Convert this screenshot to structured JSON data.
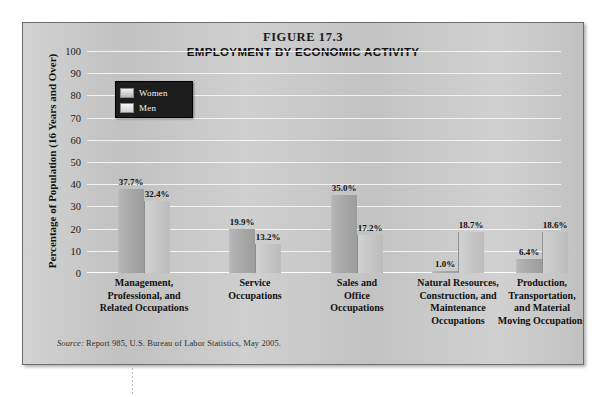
{
  "figure": {
    "number": "FIGURE 17.3",
    "title": "EMPLOYMENT BY ECONOMIC ACTIVITY",
    "source_word": "Source:",
    "source_text": " Report 985, U.S. Bureau of Labor Statistics, May 2005."
  },
  "legend": {
    "women_label": "Women",
    "men_label": "Men"
  },
  "axis": {
    "y_title": "Percentage of Population (16 Years and Over)",
    "ticks": [
      "100",
      "90",
      "80",
      "70",
      "60",
      "50",
      "40",
      "30",
      "20",
      "10",
      "0"
    ]
  },
  "categories": [
    {
      "line1": "Management,",
      "line2": "Professional, and",
      "line3": "Related Occupations"
    },
    {
      "line1": "Service",
      "line2": "Occupations",
      "line3": ""
    },
    {
      "line1": "Sales and",
      "line2": "Office",
      "line3": "Occupations"
    },
    {
      "line1": "Natural Resources,",
      "line2": "Construction, and",
      "line3": "Maintenance",
      "line4": "Occupations"
    },
    {
      "line1": "Production,",
      "line2": "Transportation,",
      "line3": "and Material",
      "line4": "Moving Occupations"
    }
  ],
  "values": {
    "women": [
      "37.7%",
      "19.9%",
      "35.0%",
      "1.0%",
      "6.4%"
    ],
    "men": [
      "32.4%",
      "13.2%",
      "17.2%",
      "18.7%",
      "18.6%"
    ]
  },
  "chart_data": {
    "type": "bar",
    "title": "EMPLOYMENT BY ECONOMIC ACTIVITY",
    "subtitle": "FIGURE 17.3",
    "xlabel": "",
    "ylabel": "Percentage of Population (16 Years and Over)",
    "ylim": [
      0,
      100
    ],
    "ytick_step": 10,
    "grid": true,
    "legend_position": "upper-left",
    "source": "Source: Report 985, U.S. Bureau of Labor Statistics, May 2005.",
    "categories": [
      "Management, Professional, and Related Occupations",
      "Service Occupations",
      "Sales and Office Occupations",
      "Natural Resources, Construction, and Maintenance Occupations",
      "Production, Transportation, and Material Moving Occupations"
    ],
    "series": [
      {
        "name": "Women",
        "values": [
          37.7,
          19.9,
          35.0,
          1.0,
          6.4
        ],
        "color": "#a8a8a8"
      },
      {
        "name": "Men",
        "values": [
          32.4,
          13.2,
          17.2,
          18.7,
          18.6
        ],
        "color": "#c6c6c6"
      }
    ],
    "data_labels": [
      {
        "category": "Management, Professional, and Related Occupations",
        "Women": "37.7%",
        "Men": "32.4%"
      },
      {
        "category": "Service Occupations",
        "Women": "19.9%",
        "Men": "13.2%"
      },
      {
        "category": "Sales and Office Occupations",
        "Women": "35.0%",
        "Men": "17.2%"
      },
      {
        "category": "Natural Resources, Construction, and Maintenance Occupations",
        "Women": "1.0%",
        "Men": "18.7%"
      },
      {
        "category": "Production, Transportation, and Material Moving Occupations",
        "Women": "6.4%",
        "Men": "18.6%"
      }
    ]
  }
}
